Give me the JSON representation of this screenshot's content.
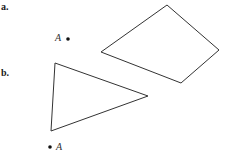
{
  "parts": [
    {
      "label": "a.",
      "point_label": "A",
      "shape": "quadrilateral",
      "vertices": [
        [
          101,
          52
        ],
        [
          167,
          5
        ],
        [
          219,
          50
        ],
        [
          181,
          83
        ]
      ],
      "point": [
        68,
        38
      ]
    },
    {
      "label": "b.",
      "point_label": "A",
      "shape": "triangle",
      "vertices": [
        [
          55,
          63
        ],
        [
          148,
          96
        ],
        [
          51,
          131
        ]
      ],
      "point": [
        50,
        147
      ]
    }
  ],
  "colors": {
    "stroke": "#333333",
    "text": "#1a1a1a"
  }
}
